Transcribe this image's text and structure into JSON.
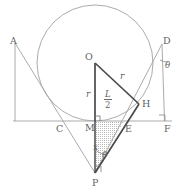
{
  "figure": {
    "type": "geometry-diagram",
    "canvas": {
      "width": 177,
      "height": 193,
      "background": "#ffffff"
    },
    "colors": {
      "thin_stroke": "#9a9a9a",
      "bold_stroke": "#4a4a4a",
      "label_text": "#5f5f5f",
      "shading_dots": "#b0b0b0"
    },
    "point_labels": [
      {
        "name": "A",
        "text": "A",
        "x": 10,
        "y": 36
      },
      {
        "name": "D",
        "text": "D",
        "x": 163,
        "y": 36
      },
      {
        "name": "O",
        "text": "O",
        "x": 85,
        "y": 54
      },
      {
        "name": "H",
        "text": "H",
        "x": 142,
        "y": 98
      },
      {
        "name": "C",
        "text": "C",
        "x": 57,
        "y": 125
      },
      {
        "name": "M",
        "text": "M",
        "x": 87,
        "y": 124
      },
      {
        "name": "E",
        "text": "E",
        "x": 125,
        "y": 126
      },
      {
        "name": "F",
        "text": "F",
        "x": 163,
        "y": 125
      },
      {
        "name": "P",
        "text": "P",
        "x": 92,
        "y": 177
      }
    ],
    "measure_labels": [
      {
        "name": "radius-vertical",
        "text": "r",
        "x": 84,
        "y": 91
      },
      {
        "name": "radius-to-h",
        "text": "r",
        "x": 120,
        "y": 73
      },
      {
        "name": "height-x",
        "text": "x",
        "x": 94,
        "y": 145
      },
      {
        "name": "angle-theta-at-p",
        "text": "θ",
        "x": 103,
        "y": 152
      },
      {
        "name": "angle-theta-at-d",
        "text": "θ",
        "x": 166,
        "y": 64
      }
    ],
    "fraction_labels": [
      {
        "name": "half-L",
        "numerator": "L",
        "denominator": "2",
        "x": 106,
        "y": 94
      }
    ]
  },
  "geometry": {
    "circle": {
      "cx": 95,
      "cy": 63,
      "r": 58
    },
    "points": {
      "A": {
        "x": 15,
        "y": 43
      },
      "D": {
        "x": 162,
        "y": 44
      },
      "O": {
        "x": 95,
        "y": 63
      },
      "H": {
        "x": 139,
        "y": 104
      },
      "C": {
        "x": 61,
        "y": 121
      },
      "M": {
        "x": 95,
        "y": 121
      },
      "E": {
        "x": 124,
        "y": 121
      },
      "F": {
        "x": 165,
        "y": 121
      },
      "P": {
        "x": 95,
        "y": 173
      }
    },
    "baseline": {
      "x1": 13,
      "y1": 121,
      "x2": 172,
      "y2": 121
    }
  }
}
